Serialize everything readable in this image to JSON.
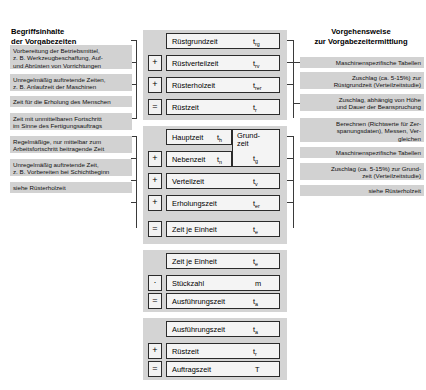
{
  "headings": {
    "left_line1": "Begriffsinhalte",
    "left_line2": "der Vorgabezeiten",
    "right_line1": "Vorgehensweise",
    "right_line2": "zur Vorgabezeitermittlung"
  },
  "left_descriptions": [
    {
      "id": "ruestgrundzeit-desc",
      "lines": [
        "Vorbereitung der Betriebsmittel,",
        "z. B. Werkzeugbeschaffung, Auf-",
        "und Abrüsten von Vorrichtungen"
      ]
    },
    {
      "id": "ruestverteilzeit-desc",
      "lines": [
        "Unregelmäßig auftretende Zeiten,",
        "z. B. Anlaufzeit der Maschinen"
      ]
    },
    {
      "id": "ruesterholzeit-desc",
      "lines": [
        "Zeit für die Erholung des Menschen"
      ]
    },
    {
      "id": "hauptzeit-desc",
      "lines": [
        "Zeit mit unmittelbaren Fortschritt",
        "im Sinne des Fertigungsauftrags"
      ]
    },
    {
      "id": "nebenzeit-desc",
      "lines": [
        "Regelmäßige, nur mittelbar zum",
        "Arbeitsfortschritt beitragende Zeit"
      ]
    },
    {
      "id": "verteilzeit-desc",
      "lines": [
        "Unregelmäßig auftretende Zeit,",
        "z. B. Vorbereiten bei Schichtbeginn"
      ]
    },
    {
      "id": "erholungszeit-desc",
      "lines": [
        "siehe Rüsterholzeit"
      ]
    }
  ],
  "right_descriptions": [
    {
      "id": "ruestgrundzeit-method",
      "lines": [
        "Maschinenspezifische Tabellen"
      ]
    },
    {
      "id": "ruestverteilzeit-method",
      "lines": [
        "Zuschlag (ca. 5-15%) zur",
        "Rüstgrundzeit (Verteilzeitstudie)"
      ]
    },
    {
      "id": "ruesterholzeit-method",
      "lines": [
        "Zuschlag, abhängig von Höhe",
        "und Dauer der Beanspruchung"
      ]
    },
    {
      "id": "grundzeit-method",
      "lines": [
        "Berechnen (Richtwerte für Zer-",
        "spanungsdaten), Messen, Ver-",
        "gleichen"
      ]
    },
    {
      "id": "nebenzeit-method",
      "lines": [
        "Maschinenspezifische Tabellen"
      ]
    },
    {
      "id": "verteilzeit-method",
      "lines": [
        "Zuschlag (ca. 5-15%) zur Grund-",
        "zeit (Verteilzeitstudie)"
      ]
    },
    {
      "id": "erholungszeit-method",
      "lines": [
        "siehe Rüsterholzeit"
      ]
    }
  ],
  "blocks": [
    {
      "id": "ruestzeit-block",
      "rows": [
        {
          "op": "",
          "label": "Rüstgrundzeit",
          "sym": "t",
          "sub": "rg"
        },
        {
          "op": "+",
          "label": "Rüstverteilzeit",
          "sym": "t",
          "sub": "rv"
        },
        {
          "op": "+",
          "label": "Rüsterholzeit",
          "sym": "t",
          "sub": "rer"
        },
        {
          "op": "=",
          "label": "Rüstzeit",
          "sym": "t",
          "sub": "r"
        }
      ]
    },
    {
      "id": "zeit-je-einheit-block",
      "group": {
        "label1": "Grund-",
        "label2": "zeit",
        "sym": "t",
        "sub": "g"
      },
      "rows": [
        {
          "op": "",
          "label": "Hauptzeit",
          "sym": "t",
          "sub": "h"
        },
        {
          "op": "+",
          "label": "Nebenzeit",
          "sym": "t",
          "sub": "n"
        },
        {
          "op": "+",
          "label": "Verteilzeit",
          "sym": "t",
          "sub": "v"
        },
        {
          "op": "+",
          "label": "Erholungszeit",
          "sym": "t",
          "sub": "er"
        },
        {
          "op": "=",
          "label": "Zeit je Einheit",
          "sym": "t",
          "sub": "e"
        }
      ]
    },
    {
      "id": "ausfuehrungszeit-block",
      "rows": [
        {
          "op": "",
          "label": "Zeit je Einheit",
          "sym": "t",
          "sub": "e"
        },
        {
          "op": "·",
          "label": "Stückzahl",
          "sym": "m",
          "sub": ""
        },
        {
          "op": "=",
          "label": "Ausführungszeit",
          "sym": "t",
          "sub": "a"
        }
      ]
    },
    {
      "id": "auftragszeit-block",
      "rows": [
        {
          "op": "",
          "label": "Ausführungszeit",
          "sym": "t",
          "sub": "a"
        },
        {
          "op": "+",
          "label": "Rüstzeit",
          "sym": "t",
          "sub": "r"
        },
        {
          "op": "=",
          "label": "Auftragszeit",
          "sym": "T",
          "sub": ""
        }
      ]
    }
  ],
  "colors": {
    "strip_bg": "#d2d2d2",
    "panel_bg": "#d4d4d4",
    "box_border": "#2b2b2b",
    "box_bg": "#f4f4f4",
    "page_bg": "#ffffff"
  }
}
